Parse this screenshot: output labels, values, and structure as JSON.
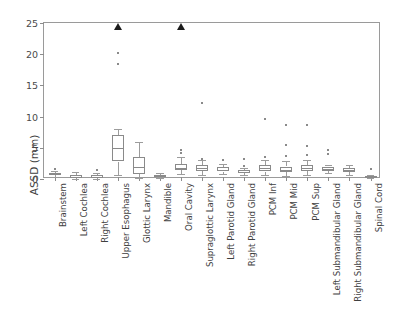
{
  "chart_data": {
    "type": "box",
    "title": "",
    "xlabel": "",
    "ylabel": "ASSD (mm)",
    "ylim": [
      0,
      25
    ],
    "yticks": [
      0,
      5,
      10,
      15,
      20,
      25
    ],
    "grid": false,
    "legend": "none",
    "categories": [
      "Brainstem",
      "Left Cochlea",
      "Right Cochlea",
      "Upper Esophagus",
      "Glottic Larynx",
      "Mandible",
      "Oral Cavity",
      "Supraglottic Larynx",
      "Left Parotid Gland",
      "Right Parotid Gland",
      "PCM Inf",
      "PCM Mid",
      "PCM Sup",
      "Left Submandibular Gland",
      "Right Submandibular Gland",
      "Spinal Cord"
    ],
    "boxes": [
      {
        "category": "Brainstem",
        "whisker_low": 0.3,
        "q1": 0.6,
        "median": 0.8,
        "q3": 1.0,
        "whisker_high": 1.3,
        "fliers": [
          2.0
        ]
      },
      {
        "category": "Left Cochlea",
        "whisker_low": 0.0,
        "q1": 0.2,
        "median": 0.4,
        "q3": 0.6,
        "whisker_high": 1.1,
        "fliers": []
      },
      {
        "category": "Right Cochlea",
        "whisker_low": 0.0,
        "q1": 0.2,
        "median": 0.4,
        "q3": 0.6,
        "whisker_high": 0.9,
        "fliers": [
          1.7
        ]
      },
      {
        "category": "Upper Esophagus",
        "whisker_low": 0.7,
        "q1": 2.8,
        "median": 5.0,
        "q3": 7.0,
        "whisker_high": 8.0,
        "fliers": [
          18.8,
          20.5,
          24.0
        ]
      },
      {
        "category": "Glottic Larynx",
        "whisker_low": 0.2,
        "q1": 0.8,
        "median": 2.0,
        "q3": 3.5,
        "whisker_high": 6.0,
        "fliers": []
      },
      {
        "category": "Mandible",
        "whisker_low": 0.2,
        "q1": 0.4,
        "median": 0.5,
        "q3": 0.7,
        "whisker_high": 0.9,
        "fliers": []
      },
      {
        "category": "Oral Cavity",
        "whisker_low": 0.8,
        "q1": 1.4,
        "median": 1.8,
        "q3": 2.4,
        "whisker_high": 3.6,
        "fliers": [
          4.5,
          5.0,
          24.0
        ]
      },
      {
        "category": "Supraglottic Larynx",
        "whisker_low": 0.7,
        "q1": 1.3,
        "median": 1.7,
        "q3": 2.2,
        "whisker_high": 3.0,
        "fliers": [
          3.6,
          12.5
        ]
      },
      {
        "category": "Left Parotid Gland",
        "whisker_low": 0.8,
        "q1": 1.2,
        "median": 1.5,
        "q3": 1.9,
        "whisker_high": 2.4,
        "fliers": [
          3.3
        ]
      },
      {
        "category": "Right Parotid Gland",
        "whisker_low": 0.6,
        "q1": 0.9,
        "median": 1.1,
        "q3": 1.4,
        "whisker_high": 1.8,
        "fliers": [
          2.4,
          3.6
        ]
      },
      {
        "category": "PCM Inf",
        "whisker_low": 0.6,
        "q1": 1.2,
        "median": 1.7,
        "q3": 2.2,
        "whisker_high": 3.0,
        "fliers": [
          3.8,
          10.0
        ]
      },
      {
        "category": "PCM Mid",
        "whisker_low": 0.5,
        "q1": 1.1,
        "median": 1.5,
        "q3": 2.0,
        "whisker_high": 2.9,
        "fliers": [
          4.0,
          5.7,
          9.0
        ]
      },
      {
        "category": "PCM Sup",
        "whisker_low": 0.7,
        "q1": 1.3,
        "median": 1.8,
        "q3": 2.3,
        "whisker_high": 3.1,
        "fliers": [
          4.1,
          5.6,
          9.0
        ]
      },
      {
        "category": "Left Submandibular Gland",
        "whisker_low": 1.0,
        "q1": 1.3,
        "median": 1.6,
        "q3": 2.0,
        "whisker_high": 2.3,
        "fliers": [
          4.4,
          4.9
        ]
      },
      {
        "category": "Right Submandibular Gland",
        "whisker_low": 0.6,
        "q1": 1.1,
        "median": 1.4,
        "q3": 1.8,
        "whisker_high": 2.3,
        "fliers": []
      },
      {
        "category": "Spinal Cord",
        "whisker_low": 0.2,
        "q1": 0.3,
        "median": 0.4,
        "q3": 0.5,
        "whisker_high": 0.7,
        "fliers": [
          1.9
        ]
      }
    ],
    "marker_notes": {
      "triangle_marker_value": 24.0,
      "triangle_categories": [
        "Upper Esophagus",
        "Oral Cavity"
      ]
    },
    "colors": {
      "box_edge": "#8a8a8a",
      "whisker": "#9c9c9c",
      "flier": "#8a8a8a",
      "triangle": "#1c1c1c",
      "axis": "#9a9a9a",
      "text": "#3f3f3f",
      "background": "#ffffff"
    }
  }
}
